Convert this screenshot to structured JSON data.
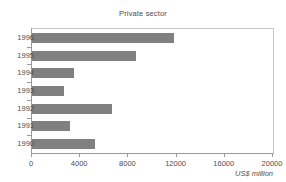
{
  "chart_data": {
    "type": "bar",
    "orientation": "horizontal",
    "title": "Private sector",
    "xlabel": "US$ million",
    "ylabel": "",
    "categories": [
      "1996",
      "1995",
      "1994",
      "1993",
      "1992",
      "1991",
      "1990"
    ],
    "values": [
      11800,
      8600,
      3500,
      2650,
      6650,
      3150,
      5250
    ],
    "xlim": [
      0,
      20000
    ],
    "xticks": [
      0,
      4000,
      8000,
      12000,
      16000,
      20000
    ],
    "xtick_labels": [
      "0",
      "4000",
      "8000",
      "12000",
      "16000",
      "20000"
    ],
    "grid": false,
    "legend": null,
    "series": [
      {
        "name": "Private sector",
        "color": "#808080",
        "values": [
          11800,
          8600,
          3500,
          2650,
          6650,
          3150,
          5250
        ]
      }
    ]
  },
  "colors": {
    "bar": "#808080",
    "axis": "#9a9a9a",
    "frame": "#c9c9c9",
    "text": "#4d4d4d",
    "background": "#ffffff"
  }
}
